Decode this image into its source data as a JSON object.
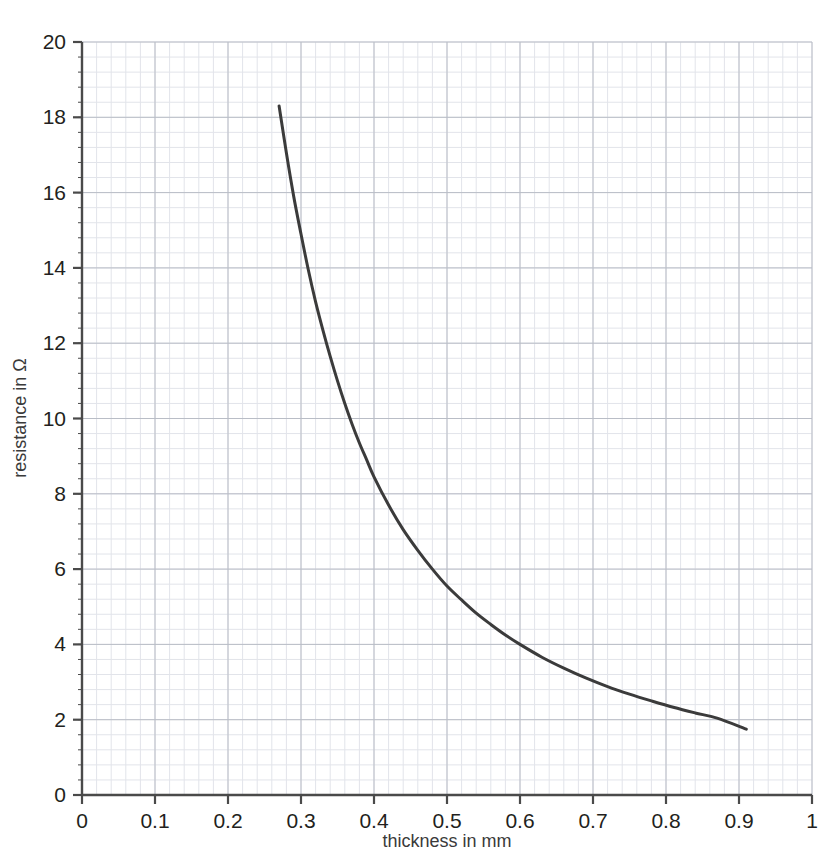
{
  "chart_data": {
    "type": "line",
    "title": "",
    "xlabel": "thickness in mm",
    "ylabel": "resistance in Ω",
    "xlim": [
      0,
      1
    ],
    "ylim": [
      0,
      20
    ],
    "x_ticks": [
      "0",
      "0.1",
      "0.2",
      "0.3",
      "0.4",
      "0.5",
      "0.6",
      "0.7",
      "0.8",
      "0.9",
      "1"
    ],
    "x_tick_values": [
      0,
      0.1,
      0.2,
      0.3,
      0.4,
      0.5,
      0.6,
      0.7,
      0.8,
      0.9,
      1
    ],
    "y_ticks": [
      "0",
      "2",
      "4",
      "6",
      "8",
      "10",
      "12",
      "14",
      "16",
      "18",
      "20"
    ],
    "y_tick_values": [
      0,
      2,
      4,
      6,
      8,
      10,
      12,
      14,
      16,
      18,
      20
    ],
    "grid": "major-and-minor",
    "grid_major_x_step": 0.1,
    "grid_major_y_step": 2,
    "grid_minor_x_step": 0.02,
    "grid_minor_y_step": 0.4,
    "legend": "none",
    "series": [
      {
        "name": "resistance vs thickness",
        "color": "#3b3b3b",
        "line_width": 3,
        "x": [
          0.27,
          0.28,
          0.29,
          0.3,
          0.31,
          0.32,
          0.33,
          0.34,
          0.35,
          0.36,
          0.37,
          0.38,
          0.39,
          0.4,
          0.42,
          0.44,
          0.46,
          0.48,
          0.5,
          0.52,
          0.54,
          0.56,
          0.58,
          0.6,
          0.63,
          0.66,
          0.69,
          0.72,
          0.75,
          0.78,
          0.81,
          0.84,
          0.87,
          0.91
        ],
        "values": [
          18.3,
          17.05,
          15.9,
          14.9,
          13.95,
          13.1,
          12.35,
          11.65,
          11.0,
          10.4,
          9.85,
          9.35,
          8.9,
          8.45,
          7.7,
          7.05,
          6.5,
          6.0,
          5.55,
          5.18,
          4.83,
          4.53,
          4.25,
          4.0,
          3.66,
          3.37,
          3.11,
          2.88,
          2.68,
          2.5,
          2.33,
          2.18,
          2.04,
          1.75
        ]
      }
    ]
  },
  "axis_colors": {
    "axis_line": "#4a4a4a",
    "grid_major": "#b9bdc6",
    "grid_minor": "#e2e4ea",
    "curve": "#3b3b3b",
    "text": "#231f20"
  }
}
